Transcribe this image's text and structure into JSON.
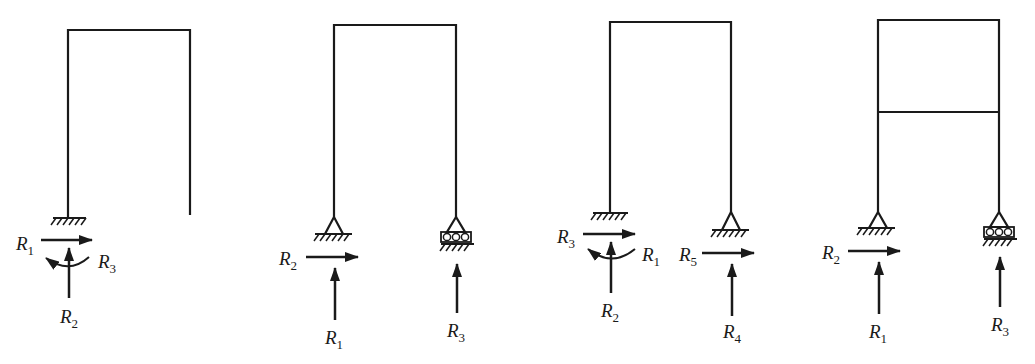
{
  "figure": {
    "colors": {
      "stroke": "#1a1a1a",
      "background": "#ffffff"
    },
    "frames": [
      {
        "id": "frame-1",
        "type": "portal frame, left leg fixed, right leg free",
        "supports": [
          "fixed",
          "free"
        ],
        "labels": {
          "r1": {
            "base": "R",
            "sub": "1"
          },
          "r2": {
            "base": "R",
            "sub": "2"
          },
          "r3": {
            "base": "R",
            "sub": "3"
          }
        }
      },
      {
        "id": "frame-2",
        "type": "portal frame, pin + roller",
        "supports": [
          "pin",
          "roller"
        ],
        "labels": {
          "r2": {
            "base": "R",
            "sub": "2"
          },
          "r1": {
            "base": "R",
            "sub": "1"
          },
          "r3": {
            "base": "R",
            "sub": "3"
          }
        }
      },
      {
        "id": "frame-3",
        "type": "portal frame, fixed + pin",
        "supports": [
          "fixed",
          "pin"
        ],
        "labels": {
          "r3": {
            "base": "R",
            "sub": "3"
          },
          "r1": {
            "base": "R",
            "sub": "1"
          },
          "r2": {
            "base": "R",
            "sub": "2"
          },
          "r5": {
            "base": "R",
            "sub": "5"
          },
          "r4": {
            "base": "R",
            "sub": "4"
          }
        }
      },
      {
        "id": "frame-4",
        "type": "two-storey frame, pin + roller",
        "supports": [
          "pin",
          "roller"
        ],
        "labels": {
          "r2": {
            "base": "R",
            "sub": "2"
          },
          "r1": {
            "base": "R",
            "sub": "1"
          },
          "r3": {
            "base": "R",
            "sub": "3"
          }
        }
      }
    ]
  }
}
